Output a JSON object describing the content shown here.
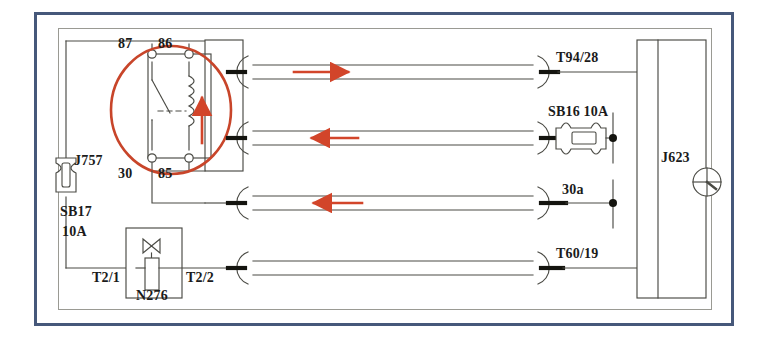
{
  "diagram": {
    "frame": {
      "outer_border_color": "#46587a",
      "inner_border_color": "#9a9a93",
      "background": "#ffffff"
    },
    "colors": {
      "wire": "#4a4a44",
      "highlight": "#c8452a",
      "arrow": "#d2452a",
      "terminal_fill": "#ffffff",
      "junction": "#14140f",
      "text": "#1b1b1b"
    }
  },
  "components": {
    "relay": {
      "name": "J757",
      "label": "J757",
      "terminals": {
        "top_left": "87",
        "top_right": "86",
        "bottom_left": "30",
        "bottom_right": "85"
      },
      "highlight_shape": "circle",
      "coil_arrow_direction": "up"
    },
    "fuse_sb17": {
      "label_line1": "SB17",
      "label_line2": "10A",
      "rating": "10A",
      "orientation": "vertical"
    },
    "fuse_sb16": {
      "label": "SB16 10A",
      "rating": "10A",
      "orientation": "horizontal"
    },
    "valve_n276": {
      "label": "N276",
      "pin_left": "T2/1",
      "pin_right": "T2/2",
      "symbol": "solenoid-valve"
    },
    "module_j623": {
      "label": "J623",
      "symbol": "engine-icon"
    }
  },
  "connections": [
    {
      "id": "row-1",
      "left_terminal": "87",
      "right_label": "T94/28",
      "arrow": "right",
      "y": 72
    },
    {
      "id": "row-2",
      "left_terminal": "86",
      "right_label": "SB16 10A",
      "arrow": "left",
      "y": 138
    },
    {
      "id": "row-3",
      "left_terminal": "30",
      "right_label": "30a",
      "arrow": "left",
      "y": 203
    },
    {
      "id": "row-4",
      "left_terminal": "T2/2",
      "right_label": "T60/19",
      "arrow": "none",
      "y": 268
    }
  ],
  "labels": {
    "relay_87": "87",
    "relay_86": "86",
    "relay_30": "30",
    "relay_85": "85",
    "relay_name": "J757",
    "fuse_sb17_name": "SB17",
    "fuse_sb17_rating": "10A",
    "fuse_sb16": "SB16 10A",
    "valve_name": "N276",
    "valve_pin_left": "T2/1",
    "valve_pin_right": "T2/2",
    "module_name": "J623",
    "conn_t94_28": "T94/28",
    "conn_30a": "30a",
    "conn_t60_19": "T60/19"
  }
}
